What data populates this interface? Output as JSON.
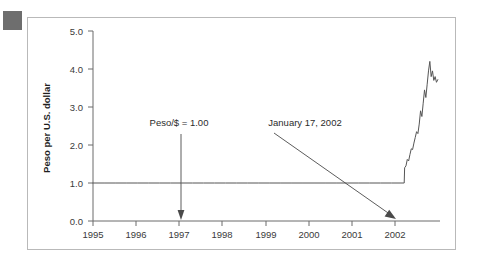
{
  "figure": {
    "corner_marker_color": "#6e6e6e",
    "frame_color": "#b9b9b9",
    "background_color": "#ffffff",
    "line_color": "#555555",
    "axis_color": "#6b6b6b"
  },
  "chart_data": {
    "type": "line",
    "title": "",
    "xlabel": "",
    "ylabel": "Peso per U.S. dollar",
    "xlim": [
      1995,
      2002.85
    ],
    "ylim": [
      0.0,
      5.0
    ],
    "grid": false,
    "legend": "none",
    "xticks": [
      1995,
      1996,
      1997,
      1998,
      1999,
      2000,
      2001,
      2002
    ],
    "xtick_labels": [
      "1995",
      "1996",
      "1997",
      "1998",
      "1999",
      "2000",
      "2001",
      "2002"
    ],
    "yticks": [
      0.0,
      1.0,
      2.0,
      3.0,
      4.0,
      5.0
    ],
    "ytick_labels": [
      "0.0",
      "1.0",
      "2.0",
      "3.0",
      "4.0",
      "5.0"
    ],
    "series": [
      {
        "name": "Peso per U.S. dollar",
        "x": [
          1995.0,
          1995.25,
          1995.5,
          1995.75,
          1996.0,
          1996.25,
          1996.5,
          1996.75,
          1997.0,
          1997.25,
          1997.5,
          1997.75,
          1998.0,
          1998.25,
          1998.5,
          1998.75,
          1999.0,
          1999.25,
          1999.5,
          1999.75,
          2000.0,
          2000.25,
          2000.5,
          2000.75,
          2001.0,
          2001.25,
          2001.5,
          2001.75,
          2002.04,
          2002.05,
          2002.08,
          2002.11,
          2002.14,
          2002.17,
          2002.2,
          2002.23,
          2002.26,
          2002.29,
          2002.32,
          2002.35,
          2002.38,
          2002.41,
          2002.44,
          2002.47,
          2002.5,
          2002.53,
          2002.56,
          2002.59,
          2002.62,
          2002.65,
          2002.68,
          2002.71,
          2002.74,
          2002.77,
          2002.8
        ],
        "y": [
          1.0,
          1.0,
          1.0,
          1.0,
          1.0,
          1.0,
          1.0,
          1.0,
          1.0,
          1.0,
          1.0,
          1.0,
          1.0,
          1.0,
          1.0,
          1.0,
          1.0,
          1.0,
          1.0,
          1.0,
          1.0,
          1.0,
          1.0,
          1.0,
          1.0,
          1.0,
          1.0,
          1.0,
          1.0,
          1.4,
          1.45,
          1.62,
          1.58,
          1.75,
          1.9,
          1.88,
          2.05,
          2.2,
          2.35,
          2.3,
          2.55,
          2.9,
          2.75,
          3.1,
          3.45,
          3.25,
          3.6,
          3.95,
          4.2,
          3.8,
          3.95,
          3.7,
          3.8,
          3.65,
          3.72
        ]
      }
    ],
    "annotations": [
      {
        "id": "peg-annotation",
        "text": "Peso/$ = 1.00",
        "text_x": 1997.0,
        "text_y": 2.52,
        "arrow_to_x": 1997.05,
        "arrow_to_y": 1.0,
        "style": "vertical-arrow"
      },
      {
        "id": "devaluation-annotation",
        "text": "January 17, 2002",
        "text_x": 2000.55,
        "text_y": 2.52,
        "arrow_to_x": 2002.03,
        "arrow_to_y": 1.0,
        "style": "diagonal-arrow"
      }
    ]
  }
}
